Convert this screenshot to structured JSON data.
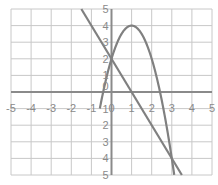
{
  "chart_data": {
    "type": "line",
    "title": "",
    "xlabel": "",
    "ylabel": "",
    "xlim": [
      -5,
      5
    ],
    "ylim": [
      -5,
      5
    ],
    "grid": true,
    "legend": "none",
    "x_ticks": [
      "-5",
      "-4",
      "-3",
      "-2",
      "-1",
      "0",
      "1",
      "2",
      "3",
      "4",
      "5"
    ],
    "y_ticks": [
      "-5",
      "-4",
      "-3",
      "-2",
      "-1",
      "0",
      "1",
      "2",
      "3",
      "4",
      "5"
    ],
    "series": [
      {
        "name": "parabola",
        "equation": "y = -2(x-1)^2 + 4",
        "x": [
          -0.58,
          -0.5,
          -0.41,
          0,
          0.5,
          1,
          1.5,
          2,
          2.41,
          2.5,
          3,
          3.12
        ],
        "y": [
          -5,
          -4.5,
          0,
          2,
          3.5,
          4,
          3.5,
          2,
          0,
          -0.5,
          -4,
          -5
        ],
        "color": "#808080"
      },
      {
        "name": "line",
        "equation": "y = -2x + 2",
        "x": [
          -1.5,
          0,
          1,
          3,
          3.5
        ],
        "y": [
          5,
          2,
          0,
          -4,
          -5
        ],
        "color": "#808080"
      }
    ],
    "intersections": [
      [
        0,
        2
      ],
      [
        3,
        -4
      ]
    ]
  },
  "colors": {
    "grid": "#c8c8c8",
    "axis": "#8a8a8a",
    "curve": "#808080",
    "label": "#8a8a8a"
  }
}
